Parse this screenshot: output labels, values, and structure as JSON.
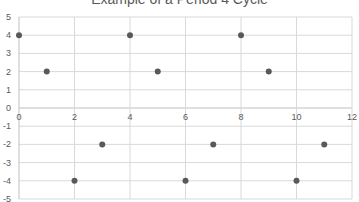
{
  "chart_data": {
    "type": "scatter",
    "title": "Example of a Period 4 Cycle",
    "xlabel": "",
    "ylabel": "",
    "xlim": [
      0,
      12
    ],
    "ylim": [
      -5,
      5
    ],
    "x_ticks": [
      0,
      2,
      4,
      6,
      8,
      10,
      12
    ],
    "y_ticks": [
      5,
      4,
      3,
      2,
      1,
      0,
      -1,
      -2,
      -3,
      -4,
      -5
    ],
    "grid": true,
    "legend": "none",
    "series": [
      {
        "name": "Series1",
        "color": "#595959",
        "points": [
          {
            "x": 0,
            "y": 4
          },
          {
            "x": 1,
            "y": 2
          },
          {
            "x": 2,
            "y": -4
          },
          {
            "x": 3,
            "y": -2
          },
          {
            "x": 4,
            "y": 4
          },
          {
            "x": 5,
            "y": 2
          },
          {
            "x": 6,
            "y": -4
          },
          {
            "x": 7,
            "y": -2
          },
          {
            "x": 8,
            "y": 4
          },
          {
            "x": 9,
            "y": 2
          },
          {
            "x": 10,
            "y": -4
          },
          {
            "x": 11,
            "y": -2
          }
        ]
      }
    ],
    "colors": {
      "gridline": "#d9d9d9",
      "axis_zero": "#bfbfbf",
      "tick_text": "#595959"
    }
  }
}
